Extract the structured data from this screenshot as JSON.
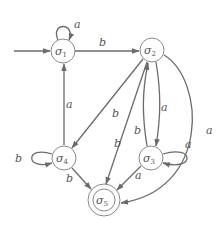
{
  "diagram": {
    "type": "finite-state-automaton",
    "states": [
      {
        "id": "s1",
        "symbol": "σ",
        "index": "1",
        "initial": true,
        "accepting": false
      },
      {
        "id": "s2",
        "symbol": "σ",
        "index": "2",
        "initial": false,
        "accepting": false
      },
      {
        "id": "s3",
        "symbol": "σ",
        "index": "3",
        "initial": false,
        "accepting": false
      },
      {
        "id": "s4",
        "symbol": "σ",
        "index": "4",
        "initial": false,
        "accepting": false
      },
      {
        "id": "s5",
        "symbol": "σ",
        "index": "5",
        "initial": false,
        "accepting": true
      }
    ],
    "transitions": [
      {
        "from": "s1",
        "to": "s1",
        "label": "a"
      },
      {
        "from": "s1",
        "to": "s2",
        "label": "b"
      },
      {
        "from": "s2",
        "to": "s4",
        "label": "b"
      },
      {
        "from": "s2",
        "to": "s5",
        "label": "b"
      },
      {
        "from": "s2",
        "to": "s3",
        "label": "a"
      },
      {
        "from": "s3",
        "to": "s2",
        "label": "b"
      },
      {
        "from": "s2",
        "to": "s5",
        "label": "a"
      },
      {
        "from": "s3",
        "to": "s3",
        "label": "a"
      },
      {
        "from": "s3",
        "to": "s5",
        "label": "a"
      },
      {
        "from": "s4",
        "to": "s1",
        "label": "a"
      },
      {
        "from": "s4",
        "to": "s4",
        "label": "b"
      },
      {
        "from": "s4",
        "to": "s5",
        "label": "b"
      }
    ],
    "labels": {
      "s1_loop": "a",
      "s1_s2": "b",
      "s2_s4": "b",
      "s2_s5": "b",
      "s2_s3": "a",
      "s3_s2": "b",
      "s2_s5_curve": "a",
      "s3_loop": "a",
      "s3_s5": "a",
      "s4_s1": "a",
      "s4_loop": "b",
      "s4_s5": "b"
    }
  }
}
